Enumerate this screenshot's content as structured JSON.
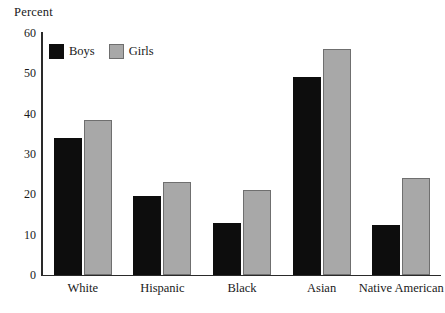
{
  "chart_data": {
    "type": "bar",
    "title": "",
    "subtitle": "",
    "xlabel": "",
    "ylabel": "Percent",
    "ylim": [
      0,
      60
    ],
    "yticks": [
      0,
      10,
      20,
      30,
      40,
      50,
      60
    ],
    "grid": false,
    "legend_position": "top-left-inside",
    "categories": [
      "White",
      "Hispanic",
      "Black",
      "Asian",
      "Native American"
    ],
    "series": [
      {
        "name": "Boys",
        "color": "#0d0d0d",
        "values": [
          34,
          19.5,
          13,
          49,
          12.5
        ]
      },
      {
        "name": "Girls",
        "color": "#a8a8a8",
        "values": [
          38.5,
          23,
          21,
          56,
          24
        ]
      }
    ]
  },
  "axis": {
    "y_title": "Percent"
  },
  "legend": {
    "items": [
      {
        "label": "Boys",
        "swatch": "boys"
      },
      {
        "label": "Girls",
        "swatch": "girls"
      }
    ]
  }
}
